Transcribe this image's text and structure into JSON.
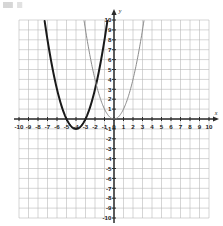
{
  "figure": {
    "title": "",
    "background_color": "#ffffff"
  },
  "chart_data": {
    "type": "line",
    "title": "",
    "xlabel": "x",
    "ylabel": "y",
    "xlim": [
      -10,
      10
    ],
    "ylim": [
      -10,
      10
    ],
    "grid": true,
    "grid_step": 1,
    "grid_color": "#b9b9b9",
    "axis_color": "#2b2b2b",
    "legend_position": "none",
    "x_tick_labels": [
      "-10",
      "-9",
      "-8",
      "-7",
      "-6",
      "-5",
      "-4",
      "-3",
      "-2",
      "-1",
      "0",
      "1",
      "2",
      "3",
      "4",
      "5",
      "6",
      "7",
      "8",
      "9",
      "10"
    ],
    "y_tick_labels": [
      "10",
      "9",
      "8",
      "7",
      "6",
      "5",
      "4",
      "3",
      "2",
      "1",
      "0",
      "-1",
      "-2",
      "-3",
      "-4",
      "-5",
      "-6",
      "-7",
      "-8",
      "-9",
      "-10"
    ],
    "series": [
      {
        "name": "translated-parabola",
        "style": "bold-dark",
        "color": "#1a1a1a",
        "line_width": 2.0,
        "curve": "parabola",
        "vertex": [
          -4,
          -1
        ],
        "a": 1,
        "x_intercepts": [
          -5,
          -3
        ],
        "points": [
          [
            -7.32,
            10.0
          ],
          [
            -7.0,
            8.0
          ],
          [
            -6.5,
            5.25
          ],
          [
            -6.0,
            3.0
          ],
          [
            -5.5,
            1.25
          ],
          [
            -5.0,
            0.0
          ],
          [
            -4.5,
            -0.75
          ],
          [
            -4.0,
            -1.0
          ],
          [
            -3.5,
            -0.75
          ],
          [
            -3.0,
            0.0
          ],
          [
            -2.5,
            1.25
          ],
          [
            -2.0,
            3.0
          ],
          [
            -1.5,
            5.25
          ],
          [
            -1.0,
            8.0
          ],
          [
            -0.68,
            10.0
          ]
        ]
      },
      {
        "name": "parent-parabola",
        "style": "thin-gray",
        "color": "#8c8c8c",
        "line_width": 1.0,
        "curve": "parabola",
        "vertex": [
          0,
          0
        ],
        "a": 1,
        "x_intercepts": [
          0
        ],
        "points": [
          [
            -3.16,
            10.0
          ],
          [
            -3.0,
            9.0
          ],
          [
            -2.5,
            6.25
          ],
          [
            -2.0,
            4.0
          ],
          [
            -1.5,
            2.25
          ],
          [
            -1.0,
            1.0
          ],
          [
            -0.5,
            0.25
          ],
          [
            0.0,
            0.0
          ],
          [
            0.5,
            0.25
          ],
          [
            1.0,
            1.0
          ],
          [
            1.5,
            2.25
          ],
          [
            2.0,
            4.0
          ],
          [
            2.5,
            6.25
          ],
          [
            3.0,
            9.0
          ],
          [
            3.16,
            10.0
          ]
        ]
      }
    ]
  }
}
